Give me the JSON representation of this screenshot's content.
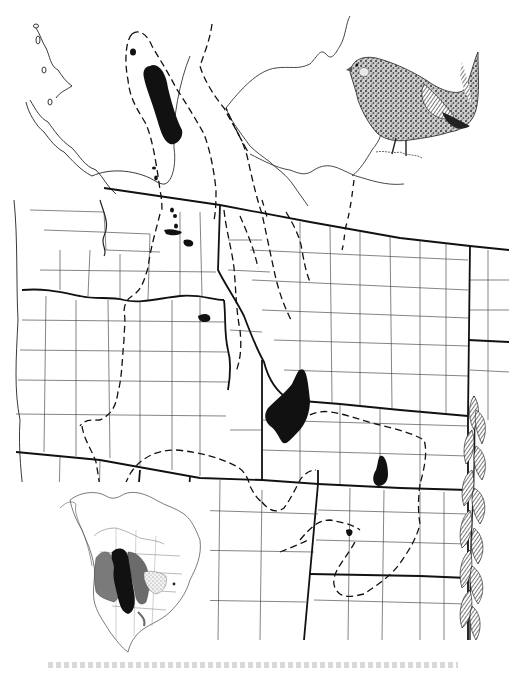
{
  "figure": {
    "type": "species range map",
    "background": "#ffffff",
    "ink_color": "#111111",
    "elements": {
      "main_map": {
        "region": "Western North America (Pacific Northwest, Northern Rockies, Great Plains, southern Canada)",
        "line_styles": {
          "state_boundary": "solid heavy",
          "county_boundary": "solid thin",
          "coastline": "solid thin",
          "range_boundary": "dashed"
        },
        "fill_legend": [
          {
            "fill": "solid black",
            "color": "#111111",
            "meaning": "core occupied range patches"
          },
          {
            "fill": "dashed outline",
            "color": "#111111",
            "meaning": "range limit"
          }
        ],
        "black_patches": [
          {
            "id": "bc-north",
            "approx_location": "northern interior British Columbia"
          },
          {
            "id": "bc-small",
            "approx_location": "small patch NW of main BC patch"
          },
          {
            "id": "wa-cluster",
            "approx_location": "north-central Washington, several small patches"
          },
          {
            "id": "wa-okanogan",
            "approx_location": "small patch near Washington/Idaho"
          },
          {
            "id": "id-small",
            "approx_location": "small patch in Idaho near Oregon border"
          },
          {
            "id": "id-east",
            "approx_location": "large patch in eastern Idaho"
          },
          {
            "id": "co-northwest",
            "approx_location": "small patch in northwestern Colorado"
          },
          {
            "id": "co-south",
            "approx_location": "tiny patch in central Colorado"
          }
        ]
      },
      "inset_map": {
        "region": "North America",
        "position": "lower-left",
        "zones": [
          {
            "fill": "black",
            "color": "#111111"
          },
          {
            "fill": "dark gray",
            "color": "#6b6b6b"
          },
          {
            "fill": "medium gray",
            "color": "#8a8a8a"
          },
          {
            "fill": "stippled",
            "color": "#bdbdbd"
          }
        ]
      },
      "illustrations": [
        {
          "id": "bird",
          "subject": "grouse (sharp-tailed)",
          "position": "upper-right",
          "style": "pen-and-ink stipple"
        },
        {
          "id": "grass",
          "subject": "grass seed head",
          "position": "right edge",
          "style": "pen-and-ink"
        }
      ],
      "caption": {
        "visible": true,
        "legible": false,
        "position": "bottom, truncated"
      }
    }
  }
}
